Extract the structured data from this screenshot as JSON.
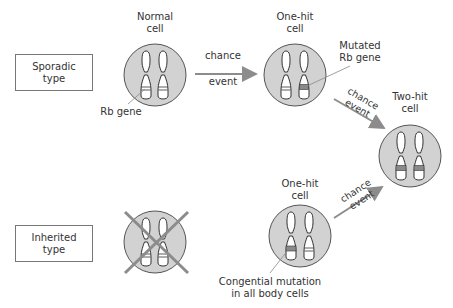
{
  "types": {
    "sporadic": "Sporadic type",
    "inherited": "Inherited type"
  },
  "cells": {
    "normal": {
      "title_1": "Normal",
      "title_2": "cell"
    },
    "sporadic_one_hit": {
      "title_1": "One-hit",
      "title_2": "cell"
    },
    "two_hit": {
      "title_1": "Two-hit",
      "title_2": "cell"
    },
    "inherited_one_hit": {
      "title_1": "One-hit",
      "title_2": "cell"
    }
  },
  "labels": {
    "rb_gene": "Rb gene",
    "mutated_1": "Mutated",
    "mutated_2": "Rb gene",
    "congenital_1": "Congential mutation",
    "congenital_2": "in all body cells"
  },
  "arrows": {
    "chance": "chance",
    "event": "event"
  },
  "colors": {
    "cell_fill": "#d2d2d2",
    "mutation_band": "#8a8a8a",
    "arrow": "#8c8c8c",
    "cross": "#8c8c8c"
  }
}
